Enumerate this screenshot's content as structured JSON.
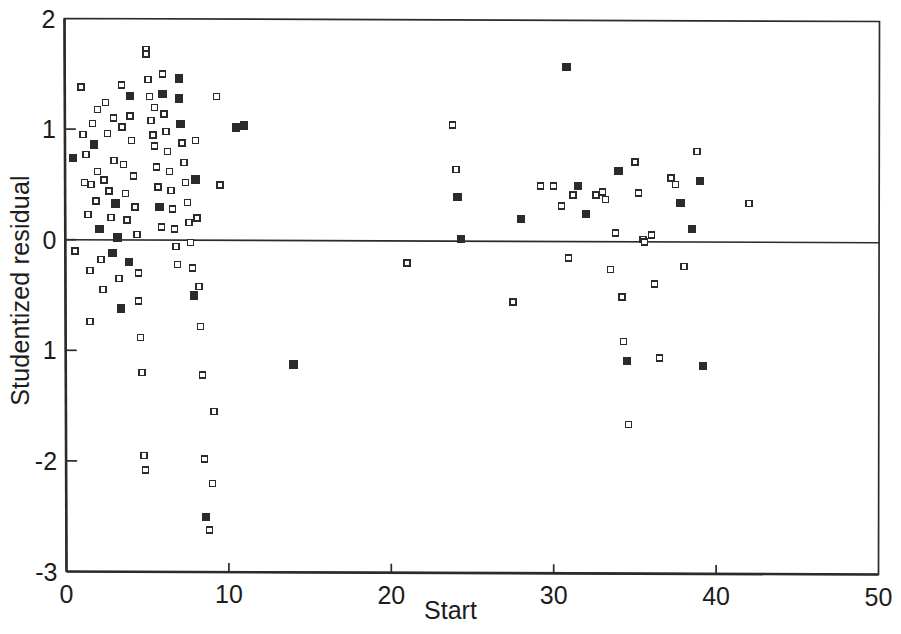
{
  "chart_data": {
    "type": "scatter",
    "title": "",
    "xlabel": "Start",
    "ylabel": "Studentized residual",
    "xlim": [
      0,
      50
    ],
    "ylim": [
      -3,
      2
    ],
    "xticks": [
      0,
      10,
      20,
      30,
      40,
      50
    ],
    "xtick_labels": [
      "0",
      "10",
      "20",
      "30",
      "40",
      "50"
    ],
    "yticks": [
      2,
      1,
      0,
      -1,
      -2,
      -3
    ],
    "ytick_labels": [
      "2",
      "1",
      "0",
      "1",
      "-2",
      "-3"
    ],
    "grid": false,
    "legend": null,
    "reference_lines": [
      {
        "orientation": "horizontal",
        "y": 0,
        "style": "solid",
        "color": "#2b2b2b"
      }
    ],
    "marker": {
      "shape": "open-square",
      "size_px": 6,
      "edge_color": "#2b2b2b",
      "face_color": "#ffffff"
    },
    "points": [
      [
        0.5,
        0.74
      ],
      [
        0.6,
        -0.1
      ],
      [
        1.0,
        1.38
      ],
      [
        1.1,
        0.95
      ],
      [
        1.2,
        0.52
      ],
      [
        1.3,
        0.77
      ],
      [
        1.4,
        0.23
      ],
      [
        1.5,
        -0.28
      ],
      [
        1.5,
        -0.74
      ],
      [
        1.6,
        0.5
      ],
      [
        1.7,
        1.05
      ],
      [
        1.8,
        0.86
      ],
      [
        1.9,
        0.35
      ],
      [
        2.0,
        1.18
      ],
      [
        2.0,
        0.62
      ],
      [
        2.1,
        0.1
      ],
      [
        2.2,
        -0.18
      ],
      [
        2.3,
        -0.45
      ],
      [
        2.4,
        0.54
      ],
      [
        2.5,
        1.24
      ],
      [
        2.6,
        0.96
      ],
      [
        2.7,
        0.44
      ],
      [
        2.8,
        0.2
      ],
      [
        2.9,
        -0.12
      ],
      [
        3.0,
        1.1
      ],
      [
        3.0,
        0.72
      ],
      [
        3.1,
        0.33
      ],
      [
        3.2,
        0.02
      ],
      [
        3.3,
        -0.35
      ],
      [
        3.4,
        -0.62
      ],
      [
        3.5,
        1.4
      ],
      [
        3.5,
        1.02
      ],
      [
        3.6,
        0.68
      ],
      [
        3.7,
        0.42
      ],
      [
        3.8,
        0.18
      ],
      [
        3.9,
        -0.2
      ],
      [
        4.0,
        1.3
      ],
      [
        4.0,
        1.12
      ],
      [
        4.1,
        0.9
      ],
      [
        4.2,
        0.58
      ],
      [
        4.3,
        0.3
      ],
      [
        4.4,
        0.05
      ],
      [
        4.5,
        -0.3
      ],
      [
        4.5,
        -0.55
      ],
      [
        4.6,
        -0.88
      ],
      [
        4.7,
        -1.2
      ],
      [
        4.8,
        -1.95
      ],
      [
        4.9,
        -2.08
      ],
      [
        5.0,
        1.72
      ],
      [
        5.0,
        1.68
      ],
      [
        5.1,
        1.45
      ],
      [
        5.2,
        1.3
      ],
      [
        5.3,
        1.08
      ],
      [
        5.4,
        0.95
      ],
      [
        5.5,
        1.2
      ],
      [
        5.5,
        0.85
      ],
      [
        5.6,
        0.66
      ],
      [
        5.7,
        0.48
      ],
      [
        5.8,
        0.3
      ],
      [
        5.9,
        0.12
      ],
      [
        6.0,
        1.5
      ],
      [
        6.0,
        1.32
      ],
      [
        6.1,
        1.14
      ],
      [
        6.2,
        0.98
      ],
      [
        6.3,
        0.8
      ],
      [
        6.4,
        0.62
      ],
      [
        6.5,
        0.45
      ],
      [
        6.6,
        0.28
      ],
      [
        6.7,
        0.1
      ],
      [
        6.8,
        -0.06
      ],
      [
        6.9,
        -0.22
      ],
      [
        7.0,
        1.46
      ],
      [
        7.0,
        1.28
      ],
      [
        7.1,
        1.05
      ],
      [
        7.2,
        0.88
      ],
      [
        7.3,
        0.7
      ],
      [
        7.4,
        0.52
      ],
      [
        7.5,
        0.34
      ],
      [
        7.6,
        0.16
      ],
      [
        7.7,
        -0.02
      ],
      [
        7.8,
        -0.25
      ],
      [
        7.9,
        -0.5
      ],
      [
        8.0,
        0.9
      ],
      [
        8.0,
        0.55
      ],
      [
        8.1,
        0.2
      ],
      [
        8.2,
        -0.42
      ],
      [
        8.3,
        -0.78
      ],
      [
        8.4,
        -1.22
      ],
      [
        8.5,
        -1.98
      ],
      [
        8.6,
        -2.5
      ],
      [
        8.8,
        -2.62
      ],
      [
        9.0,
        -2.2
      ],
      [
        9.1,
        -1.55
      ],
      [
        9.3,
        1.3
      ],
      [
        9.5,
        0.5
      ],
      [
        10.5,
        1.02
      ],
      [
        11.0,
        1.04
      ],
      [
        14.0,
        -1.12
      ],
      [
        21.0,
        -0.2
      ],
      [
        23.8,
        1.05
      ],
      [
        24.0,
        0.65
      ],
      [
        24.1,
        0.4
      ],
      [
        24.3,
        0.02
      ],
      [
        27.5,
        -0.55
      ],
      [
        28.0,
        0.2
      ],
      [
        29.2,
        0.5
      ],
      [
        30.0,
        0.5
      ],
      [
        30.5,
        0.32
      ],
      [
        30.8,
        1.58
      ],
      [
        30.9,
        -0.15
      ],
      [
        31.2,
        0.42
      ],
      [
        31.5,
        0.5
      ],
      [
        32.0,
        0.25
      ],
      [
        32.6,
        0.42
      ],
      [
        33.0,
        0.45
      ],
      [
        33.2,
        0.38
      ],
      [
        33.5,
        -0.25
      ],
      [
        33.8,
        0.08
      ],
      [
        34.0,
        0.64
      ],
      [
        34.2,
        -0.5
      ],
      [
        34.3,
        -0.9
      ],
      [
        34.5,
        -1.08
      ],
      [
        34.6,
        -1.65
      ],
      [
        35.0,
        0.72
      ],
      [
        35.2,
        0.44
      ],
      [
        35.5,
        0.02
      ],
      [
        35.6,
        0.0
      ],
      [
        36.0,
        0.06
      ],
      [
        36.2,
        -0.38
      ],
      [
        36.5,
        -1.05
      ],
      [
        37.2,
        0.58
      ],
      [
        37.5,
        0.52
      ],
      [
        37.8,
        0.35
      ],
      [
        38.0,
        -0.22
      ],
      [
        38.5,
        0.12
      ],
      [
        38.8,
        0.82
      ],
      [
        39.0,
        0.55
      ],
      [
        39.2,
        -1.12
      ],
      [
        42.0,
        0.35
      ]
    ]
  },
  "axes": {
    "frame_color": "#2b2b2b",
    "background": "#ffffff"
  }
}
